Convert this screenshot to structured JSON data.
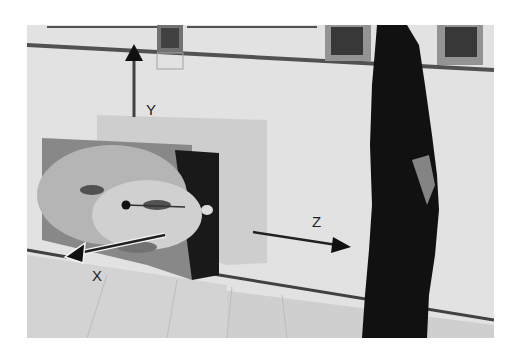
{
  "figure": {
    "axes": [
      {
        "name": "Y",
        "label": "Y",
        "direction": "up"
      },
      {
        "name": "X",
        "label": "X",
        "direction": "toward viewer / lower-left"
      },
      {
        "name": "Z",
        "label": "Z",
        "direction": "right"
      }
    ],
    "colors": {
      "background": "#ffffff",
      "wall": "#ececec",
      "figure": "#111111",
      "floor": "#dcdcdc"
    }
  }
}
